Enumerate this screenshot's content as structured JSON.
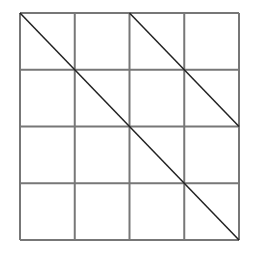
{
  "diagram": {
    "type": "grid-with-diagonals",
    "rows": 4,
    "cols": 4,
    "grid_color": "#777777",
    "line_color": "#222222",
    "background": "#ffffff",
    "bounds": {
      "x0": 20,
      "y0": 13,
      "x1": 239,
      "y1": 240
    },
    "diagonals": [
      {
        "from": [
          0,
          0
        ],
        "to": [
          4,
          4
        ]
      },
      {
        "from": [
          2,
          0
        ],
        "to": [
          4,
          2
        ]
      }
    ]
  }
}
